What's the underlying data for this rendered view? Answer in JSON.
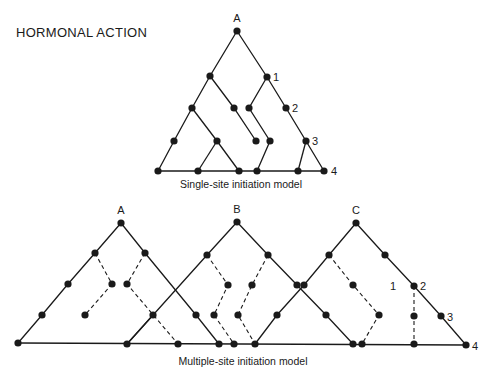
{
  "title": "HORMONAL ACTION",
  "colors": {
    "ink": "#1a1a1a",
    "background": "#ffffff"
  },
  "diagrams": [
    {
      "name": "single-site",
      "caption": "Single-site initiation model",
      "caption_pos": [
        241,
        188
      ],
      "labels": [
        {
          "text": "A",
          "x": 237,
          "y": 22,
          "anchor": "middle"
        },
        {
          "text": "1",
          "x": 273,
          "y": 81,
          "anchor": "start"
        },
        {
          "text": "2",
          "x": 292,
          "y": 112,
          "anchor": "start"
        },
        {
          "text": "3",
          "x": 312,
          "y": 145,
          "anchor": "start"
        },
        {
          "text": "4",
          "x": 331,
          "y": 175,
          "anchor": "start"
        }
      ],
      "nodes": [
        [
          237,
          31
        ],
        [
          210,
          76
        ],
        [
          267,
          77
        ],
        [
          192,
          108
        ],
        [
          234,
          108
        ],
        [
          249,
          108
        ],
        [
          286,
          108
        ],
        [
          174,
          141
        ],
        [
          217,
          141
        ],
        [
          256,
          141
        ],
        [
          270,
          141
        ],
        [
          306,
          141
        ],
        [
          158,
          171
        ],
        [
          198,
          171
        ],
        [
          239,
          171
        ],
        [
          257,
          171
        ],
        [
          298,
          171
        ],
        [
          324,
          171
        ]
      ],
      "solid": [
        [
          [
            237,
            31
          ],
          [
            210,
            76
          ],
          [
            192,
            108
          ],
          [
            174,
            141
          ],
          [
            158,
            171
          ]
        ],
        [
          [
            237,
            31
          ],
          [
            267,
            77
          ],
          [
            286,
            108
          ],
          [
            306,
            141
          ],
          [
            324,
            171
          ]
        ],
        [
          [
            210,
            76
          ],
          [
            234,
            108
          ],
          [
            256,
            141
          ]
        ],
        [
          [
            192,
            108
          ],
          [
            217,
            141
          ],
          [
            239,
            171
          ]
        ],
        [
          [
            217,
            141
          ],
          [
            198,
            171
          ]
        ],
        [
          [
            267,
            77
          ],
          [
            249,
            108
          ],
          [
            270,
            141
          ],
          [
            257,
            171
          ]
        ],
        [
          [
            306,
            141
          ],
          [
            298,
            171
          ]
        ],
        [
          [
            158,
            171
          ],
          [
            324,
            171
          ]
        ]
      ],
      "dashed": []
    },
    {
      "name": "multiple-site",
      "caption": "Multiple-site initiation model",
      "caption_pos": [
        243,
        365
      ],
      "labels": [
        {
          "text": "A",
          "x": 121,
          "y": 214,
          "anchor": "middle"
        },
        {
          "text": "B",
          "x": 237,
          "y": 213,
          "anchor": "middle"
        },
        {
          "text": "C",
          "x": 356,
          "y": 214,
          "anchor": "middle"
        },
        {
          "text": "1",
          "x": 390,
          "y": 290,
          "anchor": "start"
        },
        {
          "text": "2",
          "x": 420,
          "y": 290,
          "anchor": "start"
        },
        {
          "text": "3",
          "x": 447,
          "y": 321,
          "anchor": "start"
        },
        {
          "text": "4",
          "x": 472,
          "y": 350,
          "anchor": "start"
        }
      ],
      "nodes": [
        [
          121,
          223
        ],
        [
          95,
          253
        ],
        [
          145,
          253
        ],
        [
          68,
          284
        ],
        [
          112,
          284
        ],
        [
          127,
          284
        ],
        [
          42,
          315
        ],
        [
          85,
          315
        ],
        [
          153,
          315
        ],
        [
          18,
          343
        ],
        [
          127,
          344
        ],
        [
          178,
          344
        ],
        [
          237,
          222
        ],
        [
          207,
          255
        ],
        [
          268,
          255
        ],
        [
          228,
          285
        ],
        [
          252,
          285
        ],
        [
          297,
          285
        ],
        [
          196,
          315
        ],
        [
          214,
          315
        ],
        [
          238,
          315
        ],
        [
          277,
          315
        ],
        [
          219,
          344
        ],
        [
          234,
          344
        ],
        [
          255,
          344
        ],
        [
          356,
          223
        ],
        [
          329,
          255
        ],
        [
          385,
          255
        ],
        [
          304,
          285
        ],
        [
          353,
          285
        ],
        [
          414,
          286
        ],
        [
          326,
          315
        ],
        [
          379,
          315
        ],
        [
          414,
          316
        ],
        [
          441,
          316
        ],
        [
          353,
          344
        ],
        [
          362,
          344
        ],
        [
          414,
          344
        ],
        [
          466,
          345
        ]
      ],
      "solid": [
        [
          [
            121,
            223
          ],
          [
            95,
            253
          ],
          [
            68,
            284
          ],
          [
            42,
            315
          ],
          [
            18,
            343
          ]
        ],
        [
          [
            121,
            223
          ],
          [
            145,
            253
          ],
          [
            196,
            315
          ],
          [
            219,
            344
          ]
        ],
        [
          [
            153,
            315
          ],
          [
            127,
            344
          ]
        ],
        [
          [
            237,
            222
          ],
          [
            207,
            255
          ],
          [
            154,
            314
          ],
          [
            127,
            344
          ]
        ],
        [
          [
            237,
            222
          ],
          [
            268,
            255
          ],
          [
            297,
            285
          ],
          [
            326,
            315
          ],
          [
            353,
            344
          ]
        ],
        [
          [
            356,
            223
          ],
          [
            329,
            255
          ],
          [
            304,
            285
          ],
          [
            277,
            315
          ],
          [
            255,
            344
          ]
        ],
        [
          [
            356,
            223
          ],
          [
            385,
            255
          ],
          [
            414,
            286
          ],
          [
            441,
            316
          ],
          [
            466,
            345
          ]
        ],
        [
          [
            18,
            343
          ],
          [
            466,
            345
          ]
        ]
      ],
      "dashed": [
        [
          [
            95,
            253
          ],
          [
            112,
            284
          ],
          [
            85,
            315
          ]
        ],
        [
          [
            145,
            253
          ],
          [
            127,
            284
          ],
          [
            178,
            344
          ]
        ],
        [
          [
            207,
            255
          ],
          [
            228,
            285
          ],
          [
            214,
            315
          ],
          [
            234,
            344
          ]
        ],
        [
          [
            268,
            255
          ],
          [
            252,
            285
          ],
          [
            238,
            315
          ],
          [
            255,
            344
          ]
        ],
        [
          [
            329,
            255
          ],
          [
            353,
            285
          ],
          [
            379,
            315
          ],
          [
            362,
            344
          ]
        ],
        [
          [
            414,
            286
          ],
          [
            414,
            344
          ]
        ]
      ]
    }
  ]
}
